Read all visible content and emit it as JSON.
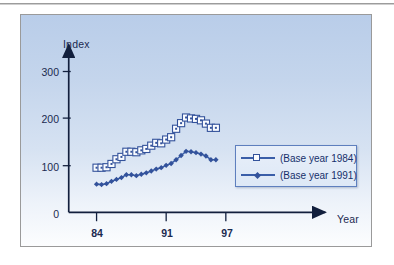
{
  "figure": {
    "background_top_color": "#b9cde9",
    "background_bottom_color": "#fcfdfe",
    "border_color": "#9a9a9a",
    "accent_color": "#3a5ea8",
    "marker_edge_color": "#33529b",
    "text_color": "#1b2a50"
  },
  "chart_data": {
    "type": "line",
    "title": "",
    "subtitle": "",
    "xlabel": "Year",
    "ylabel": "Index",
    "xlim": [
      83,
      99
    ],
    "ylim": [
      0,
      340
    ],
    "yticks": [
      0,
      100,
      200,
      300
    ],
    "ytick_labels": [
      "0",
      "100",
      "200",
      "300"
    ],
    "xticks": [
      84,
      91,
      97
    ],
    "xtick_labels": [
      "84",
      "91",
      "97"
    ],
    "grid": false,
    "legend_position": "center right",
    "x": [
      84,
      84.5,
      85,
      85.5,
      86,
      86.5,
      87,
      87.5,
      88,
      88.5,
      89,
      89.5,
      90,
      90.5,
      91,
      91.5,
      92,
      92.5,
      93,
      93.5,
      94,
      94.5,
      95,
      95.5,
      96
    ],
    "series": [
      {
        "name": "(Base year 1984)",
        "marker": "open-square",
        "color": "#3a5ea8",
        "values": [
          95,
          95,
          96,
          103,
          113,
          118,
          129,
          129,
          128,
          132,
          135,
          142,
          148,
          147,
          155,
          160,
          178,
          190,
          202,
          200,
          199,
          196,
          189,
          180,
          180
        ]
      },
      {
        "name": "(Base year 1991)",
        "marker": "filled-diamond",
        "color": "#3a5ea8",
        "values": [
          60,
          59,
          61,
          66,
          70,
          74,
          80,
          80,
          78,
          81,
          84,
          88,
          92,
          95,
          100,
          104,
          112,
          121,
          130,
          129,
          127,
          124,
          120,
          112,
          112
        ]
      }
    ]
  },
  "legend": {
    "entries": [
      {
        "label": "(Base year 1984)",
        "marker": "open-square"
      },
      {
        "label": "(Base year 1991)",
        "marker": "filled-diamond"
      }
    ]
  }
}
